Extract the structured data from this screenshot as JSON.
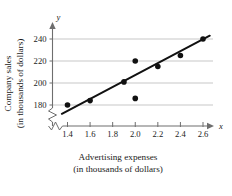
{
  "chart_data": {
    "type": "scatter",
    "title": "",
    "xlabel": "Advertising expenses (in thousands of dollars)",
    "ylabel": "Company sales (in thousands of dollars)",
    "xlabel_line1": "Advertising expenses",
    "xlabel_line2": "(in thousands of dollars)",
    "ylabel_line1": "Company sales",
    "ylabel_line2": "(in thousands of dollars)",
    "x_axis_variable": "x",
    "y_axis_variable": "y",
    "xlim": [
      1.3,
      2.7
    ],
    "ylim": [
      170,
      248
    ],
    "x_ticks": [
      1.4,
      1.6,
      1.8,
      2.0,
      2.2,
      2.4,
      2.6
    ],
    "x_tick_labels": [
      "1.4",
      "1.6",
      "1.8",
      "2.0",
      "2.2",
      "2.4",
      "2.6"
    ],
    "y_ticks": [
      180,
      200,
      220,
      240
    ],
    "y_tick_labels": [
      "180",
      "200",
      "220",
      "240"
    ],
    "grid": true,
    "grid_axis": "y",
    "axis_break": true,
    "legend": null,
    "x": [
      1.4,
      1.6,
      1.9,
      2.0,
      2.0,
      2.2,
      2.4,
      2.6
    ],
    "y": [
      180,
      184,
      201,
      220,
      186,
      215,
      225,
      240
    ],
    "points": [
      {
        "x": 1.4,
        "y": 180
      },
      {
        "x": 1.6,
        "y": 184
      },
      {
        "x": 1.9,
        "y": 201
      },
      {
        "x": 2.0,
        "y": 220
      },
      {
        "x": 2.0,
        "y": 186
      },
      {
        "x": 2.2,
        "y": 215
      },
      {
        "x": 2.4,
        "y": 225
      },
      {
        "x": 2.6,
        "y": 240
      }
    ],
    "trendline": {
      "type": "linear-regression",
      "x_start": 1.35,
      "y_start": 172,
      "x_end": 2.66,
      "y_end": 243
    }
  }
}
